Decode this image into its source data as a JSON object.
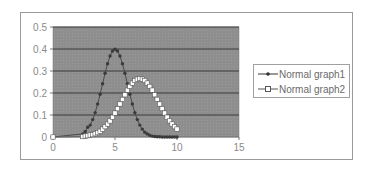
{
  "chart_data": {
    "type": "line",
    "title": "",
    "xlabel": "",
    "ylabel": "",
    "xlim": [
      0,
      15
    ],
    "ylim": [
      0,
      0.5
    ],
    "xticks": [
      0,
      5,
      10,
      15
    ],
    "yticks": [
      0,
      0.1,
      0.2,
      0.3,
      0.4,
      0.5
    ],
    "xtick_labels": [
      "0",
      "5",
      "10",
      "15"
    ],
    "ytick_labels": [
      "0",
      "0.1",
      "0.2",
      "0.3",
      "0.4",
      "0.5"
    ],
    "grid": "horizontal",
    "legend_position": "right",
    "plot_background": "#8c8c8c",
    "series": [
      {
        "name": "Normal graph1",
        "marker": "star/dot",
        "color": "#555555",
        "mean": 5,
        "sd": 1,
        "x": [
          0,
          2.4,
          2.6,
          2.8,
          3,
          3.2,
          3.4,
          3.6,
          3.8,
          4,
          4.2,
          4.4,
          4.6,
          4.8,
          5,
          5.2,
          5.4,
          5.6,
          5.8,
          6,
          6.2,
          6.4,
          6.6,
          6.8,
          7,
          7.2,
          7.4,
          7.6,
          7.8,
          8,
          8.2,
          8.4,
          8.6,
          8.8,
          9,
          9.2,
          9.4,
          9.6,
          9.8,
          10
        ],
        "y": [
          0,
          0.014,
          0.025,
          0.044,
          0.054,
          0.079,
          0.111,
          0.15,
          0.194,
          0.242,
          0.29,
          0.333,
          0.368,
          0.391,
          0.399,
          0.391,
          0.368,
          0.333,
          0.29,
          0.242,
          0.194,
          0.15,
          0.111,
          0.079,
          0.054,
          0.036,
          0.022,
          0.014,
          0.008,
          0.004,
          0.002,
          0.001,
          0.001,
          0,
          0,
          0,
          0,
          0,
          0,
          0
        ]
      },
      {
        "name": "Normal graph2",
        "marker": "square-open",
        "color": "#ffffff",
        "mean": 7,
        "sd": 1.5,
        "x": [
          0,
          2.4,
          2.6,
          2.8,
          3,
          3.2,
          3.4,
          3.6,
          3.8,
          4,
          4.2,
          4.4,
          4.6,
          4.8,
          5,
          5.2,
          5.4,
          5.6,
          5.8,
          6,
          6.2,
          6.4,
          6.6,
          6.8,
          7,
          7.2,
          7.4,
          7.6,
          7.8,
          8,
          8.2,
          8.4,
          8.6,
          8.8,
          9,
          9.2,
          9.4,
          9.6,
          9.8,
          10
        ],
        "y": [
          0,
          0.002,
          0.004,
          0.006,
          0.009,
          0.011,
          0.015,
          0.02,
          0.026,
          0.036,
          0.047,
          0.059,
          0.073,
          0.09,
          0.109,
          0.129,
          0.15,
          0.171,
          0.192,
          0.213,
          0.23,
          0.245,
          0.257,
          0.263,
          0.266,
          0.263,
          0.257,
          0.245,
          0.23,
          0.213,
          0.192,
          0.171,
          0.15,
          0.129,
          0.109,
          0.09,
          0.073,
          0.059,
          0.047,
          0.036
        ]
      }
    ]
  },
  "legend": {
    "items": [
      {
        "label": "Normal graph1"
      },
      {
        "label": "Normal graph2"
      }
    ]
  }
}
